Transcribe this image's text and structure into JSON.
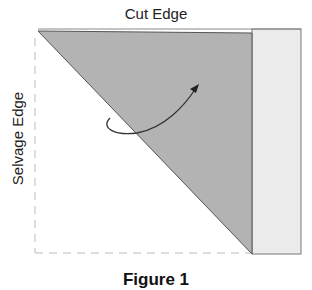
{
  "diagram": {
    "labels": {
      "top": "Cut Edge",
      "left": "Selvage Edge",
      "caption": "Figure 1"
    },
    "colors": {
      "triangle_fill": "#b3b3b3",
      "strip_fill": "#ebebeb",
      "outline": "#555555",
      "dashed_line": "#bbbbbb",
      "arrow": "#333333"
    }
  }
}
